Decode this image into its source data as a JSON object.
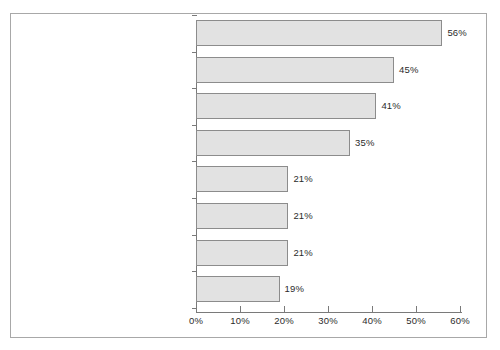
{
  "chart_data": {
    "type": "bar",
    "orientation": "horizontal",
    "title": "",
    "xlabel": "",
    "ylabel": "",
    "xlim": [
      0,
      60
    ],
    "grid": false,
    "legend": null,
    "xticks": [
      "0%",
      "10%",
      "20%",
      "30%",
      "40%",
      "50%",
      "60%"
    ],
    "xtick_values": [
      0,
      10,
      20,
      30,
      40,
      50,
      60
    ],
    "categories": [
      "Messung der Maßgrößen/Kostentreiber",
      "Definition der Maßgrößen/Kostentreiber",
      "DV-technische Umsetzung",
      "Keine ausreichenden Ressourcen",
      "Pflegeaufwand unterschätzt",
      "Prozessmodell zu detailliert/zu komplex",
      "Verwirrung wegen Paralleleinsatz\nProzesskostenmanagement / bisherige Verfahren",
      "Mangelnde Führungsunterstützung"
    ],
    "values": [
      56,
      45,
      41,
      35,
      21,
      21,
      21,
      19
    ],
    "value_labels": [
      "56%",
      "45%",
      "41%",
      "35%",
      "21%",
      "21%",
      "21%",
      "19%"
    ],
    "colors": {
      "bar_fill": "#e2e2e2",
      "bar_border": "#8c8c8c",
      "axis": "#7a7a7a",
      "frame": "#a8a8a8",
      "text": "#2b2b2b",
      "background": "#ffffff"
    }
  }
}
